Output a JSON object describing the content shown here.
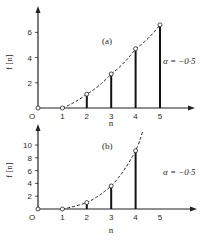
{
  "chart_data": [
    {
      "type": "bar",
      "panel_label": "(a)",
      "title": "",
      "xlabel": "n",
      "ylabel": "f [n]",
      "annotation": "α = −0·5",
      "x_ticks": [
        "O",
        "1",
        "2",
        "3",
        "4",
        "5"
      ],
      "y_ticks": [
        "2",
        "4",
        "6"
      ],
      "ylim": [
        0,
        7
      ],
      "x": [
        0,
        1,
        2,
        3,
        4,
        5
      ],
      "values": [
        0,
        0,
        1.1,
        2.7,
        4.7,
        6.6
      ],
      "curve": "dashed smooth envelope through points"
    },
    {
      "type": "bar",
      "panel_label": "(b)",
      "title": "",
      "xlabel": "n",
      "ylabel": "f [n]",
      "annotation": "α = −0·5",
      "x_ticks": [
        "O",
        "1",
        "2",
        "3",
        "4",
        "5"
      ],
      "y_ticks": [
        "2",
        "4",
        "6",
        "8",
        "10"
      ],
      "ylim": [
        0,
        12
      ],
      "x": [
        0,
        1,
        2,
        3,
        4
      ],
      "values": [
        0,
        0,
        1.0,
        3.6,
        9.1
      ],
      "curve": "dashed smooth envelope through points"
    }
  ],
  "labels": {
    "a": {
      "panel": "(a)",
      "ylabel": "f [n]",
      "xlabel": "n",
      "alpha": "α = −0·5",
      "origin": "O"
    },
    "b": {
      "panel": "(b)",
      "ylabel": "f [n]",
      "xlabel_top": "n",
      "xlabel": "n",
      "alpha": "α = −0·5",
      "origin": "O"
    }
  }
}
